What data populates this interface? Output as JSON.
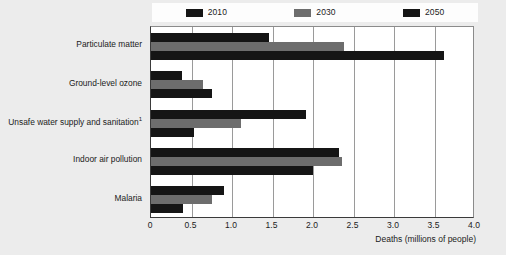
{
  "chart_data": {
    "type": "bar",
    "orientation": "horizontal",
    "title": "",
    "xlabel": "Deaths (millions of people)",
    "ylabel": "",
    "xlim": [
      0,
      4.0
    ],
    "xticks": [
      "0",
      "0.5",
      "1.0",
      "1.5",
      "2.0",
      "2.5",
      "3.0",
      "3.5",
      "4.0"
    ],
    "xtick_values": [
      0,
      0.5,
      1.0,
      1.5,
      2.0,
      2.5,
      3.0,
      3.5,
      4.0
    ],
    "grid": true,
    "legend_position": "top",
    "categories": [
      "Particulate matter",
      "Ground-level ozone",
      "Unsafe water supply and sanitation",
      "Indoor air pollution",
      "Malaria"
    ],
    "category_labels": [
      {
        "text": "Particulate matter",
        "footnote": ""
      },
      {
        "text": "Ground-level ozone",
        "footnote": ""
      },
      {
        "text": "Unsafe water supply and sanitation",
        "footnote": "1"
      },
      {
        "text": "Indoor air pollution",
        "footnote": ""
      },
      {
        "text": "Malaria",
        "footnote": ""
      }
    ],
    "series": [
      {
        "name": "2010",
        "color": "#151515",
        "values": [
          1.46,
          0.38,
          1.91,
          2.32,
          0.9
        ]
      },
      {
        "name": "2030",
        "color": "#6d6d6d",
        "values": [
          2.38,
          0.64,
          1.11,
          2.36,
          0.75
        ]
      },
      {
        "name": "2050",
        "color": "#151515",
        "values": [
          3.62,
          0.75,
          0.53,
          2.0,
          0.39
        ]
      }
    ]
  },
  "legend": {
    "items": [
      {
        "label": "2010",
        "color": "#151515"
      },
      {
        "label": "2030",
        "color": "#6d6d6d"
      },
      {
        "label": "2050",
        "color": "#151515"
      }
    ]
  },
  "axis": {
    "x_title": "Deaths (millions of people)"
  }
}
